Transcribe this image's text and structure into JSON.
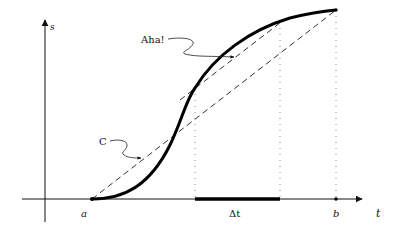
{
  "diagram": {
    "type": "mean-value-theorem",
    "axes": {
      "x_label": "t",
      "y_label": "s"
    },
    "points": {
      "a_label": "a",
      "b_label": "b"
    },
    "interval_label": "Δt",
    "annotations": {
      "tangent_label": "Aha!",
      "secant_label": "C"
    },
    "colors": {
      "curve": "#000000",
      "axes": "#111111",
      "dashed": "#333333",
      "dotted": "#888888",
      "background": "#ffffff"
    }
  }
}
